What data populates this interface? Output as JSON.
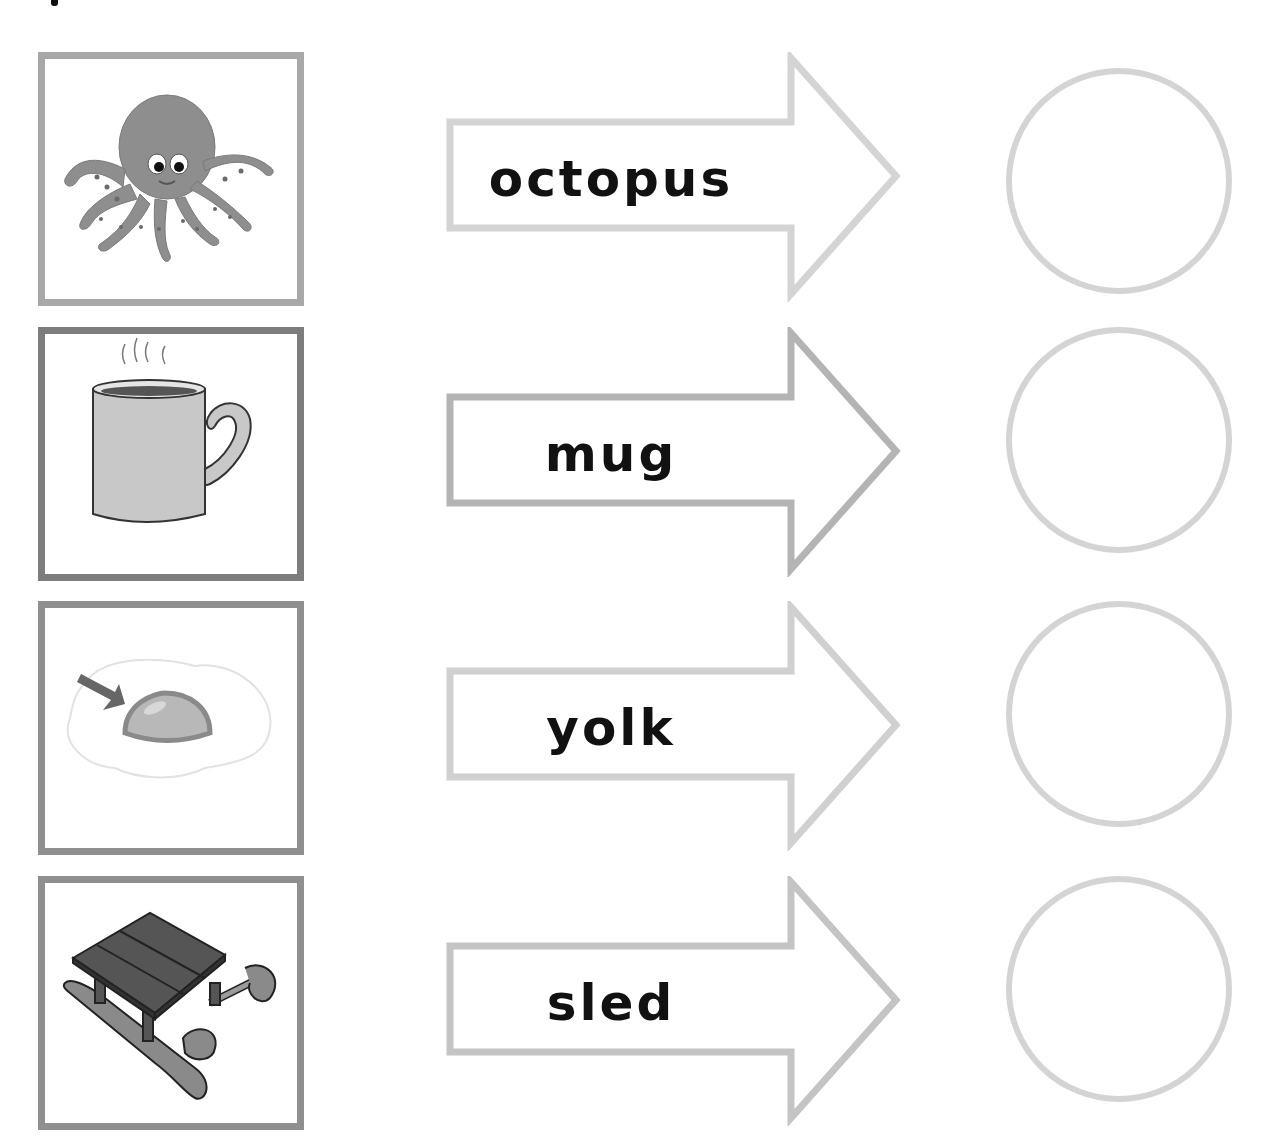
{
  "worksheet": {
    "rows": [
      {
        "word": "octopus",
        "picture": "octopus-picture",
        "frame_color": "#a8a8a8",
        "arrow_color": "#d4d4d4"
      },
      {
        "word": "mug",
        "picture": "mug-picture",
        "frame_color": "#7d7d7d",
        "arrow_color": "#b4b4b4"
      },
      {
        "word": "yolk",
        "picture": "yolk-picture",
        "frame_color": "#8f8f8f",
        "arrow_color": "#d0d0d0"
      },
      {
        "word": "sled",
        "picture": "sled-picture",
        "frame_color": "#8f8f8f",
        "arrow_color": "#c4c4c4"
      }
    ]
  },
  "colors": {
    "text": "#111111",
    "circle_border": "#d4d4d4",
    "background": "#ffffff"
  }
}
